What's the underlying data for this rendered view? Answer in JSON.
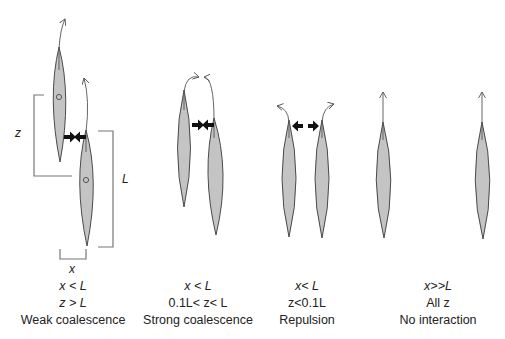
{
  "diagram": {
    "dimension_labels": {
      "z": "z",
      "L": "L",
      "x": "x"
    },
    "colors": {
      "body_fill": "#c4c4c4",
      "body_stroke": "#4a4a4a",
      "force_arrow": "#111111",
      "bracket": "#777777"
    },
    "panels": [
      {
        "id": "weak",
        "condition_1": "x < L",
        "condition_2": "z > L",
        "label": "Weak coalescence",
        "forces": "attraction"
      },
      {
        "id": "strong",
        "condition_1": "x < L",
        "condition_2": "0.1L< z< L",
        "label": "Strong coalescence",
        "forces": "attraction"
      },
      {
        "id": "repulsion",
        "condition_1": "x< L",
        "condition_2": "z<0.1L",
        "label": "Repulsion",
        "forces": "repulsion"
      },
      {
        "id": "none",
        "condition_1": "x>>L",
        "condition_2": "All z",
        "label": "No interaction",
        "forces": "none"
      }
    ]
  }
}
